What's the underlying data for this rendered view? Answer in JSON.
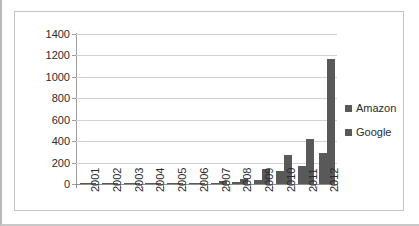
{
  "chart_data": {
    "type": "bar",
    "title": "",
    "subtitle": "",
    "xlabel": "",
    "ylabel": "",
    "categories": [
      "2001",
      "2002",
      "2003",
      "2004",
      "2005",
      "2006",
      "2007",
      "2008",
      "2009",
      "2010",
      "2011",
      "2012"
    ],
    "series": [
      {
        "name": "Amazon",
        "color": "#595959",
        "values": [
          0,
          1,
          2,
          3,
          4,
          8,
          10,
          18,
          40,
          120,
          172,
          285
        ]
      },
      {
        "name": "Google",
        "color": "#595959",
        "values": [
          1,
          3,
          5,
          5,
          6,
          12,
          28,
          48,
          140,
          275,
          420,
          1170
        ]
      }
    ],
    "ylim": [
      0,
      1400
    ],
    "ytick_values": [
      0,
      200,
      400,
      600,
      800,
      1000,
      1200,
      1400
    ],
    "ytick_labels": [
      "0",
      "200",
      "400",
      "600",
      "800",
      "1000",
      "1200",
      "1400"
    ],
    "grid": true,
    "grid_axis": "y",
    "legend_position": "right",
    "legend": [
      "Amazon",
      "Google"
    ],
    "xtick_rotation": 90
  },
  "legend": {
    "items": [
      {
        "label": "Amazon",
        "swatch_name": "legend-swatch-amazon"
      },
      {
        "label": "Google",
        "swatch_name": "legend-swatch-google"
      }
    ]
  },
  "colors": {
    "bar": "#595959",
    "gridline": "#d2d2d2",
    "axis": "#8f8f8f",
    "text": "#2b2b2b",
    "frame": "#c4c4c4",
    "background": "#ffffff"
  }
}
